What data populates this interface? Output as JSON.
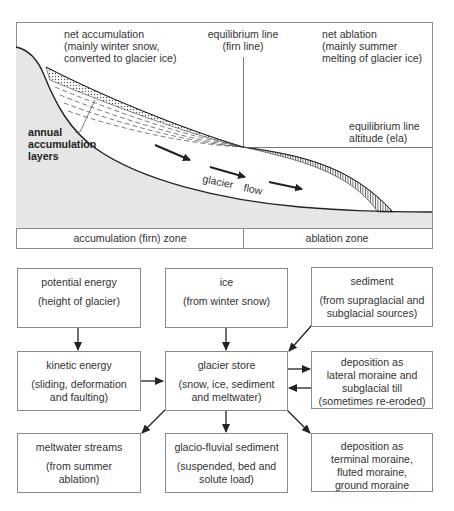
{
  "profile": {
    "labels": {
      "net_accumulation": [
        "net accumulation",
        "(mainly winter snow,",
        "converted to glacier ice)"
      ],
      "equilibrium_line": [
        "equilibrium line",
        "(firn line)"
      ],
      "net_ablation": [
        "net ablation",
        "(mainly summer",
        "melting of glacier ice)"
      ],
      "ela": [
        "equilibrium line",
        "altitude (ela)"
      ],
      "annual_layers": [
        "annual",
        "accumulation",
        "layers"
      ],
      "glacier_flow": [
        "glacier",
        "flow"
      ]
    },
    "zones": {
      "accumulation": "accumulation (firn) zone",
      "ablation": "ablation zone"
    },
    "colors": {
      "ground": "#e6e6e6",
      "line": "#222222",
      "frame": "#8a8a8a"
    }
  },
  "flowchart": {
    "boxes": {
      "potential_energy": {
        "title": "potential energy",
        "sub": "(height of glacier)"
      },
      "ice": {
        "title": "ice",
        "sub": "(from winter snow)"
      },
      "sediment": {
        "title": "sediment",
        "sub": "(from supraglacial and\nsubglacial sources)"
      },
      "kinetic_energy": {
        "title": "kinetic energy",
        "sub": "(sliding, deformation\nand faulting)"
      },
      "glacier_store": {
        "title": "glacier store",
        "sub": "(snow, ice, sediment\nand meltwater)"
      },
      "lateral_deposition": {
        "title": "deposition as",
        "sub": "lateral moraine and\nsubglacial till\n(sometimes re-eroded)"
      },
      "meltwater": {
        "title": "meltwater streams",
        "sub": "(from summer\nablation)"
      },
      "glaciofluvial": {
        "title": "glacio-fluvial sediment",
        "sub": "(suspended, bed and\nsolute load)"
      },
      "terminal_deposition": {
        "title": "deposition as",
        "sub": "terminal moraine,\nfluted moraine,\nground moraine"
      }
    }
  }
}
